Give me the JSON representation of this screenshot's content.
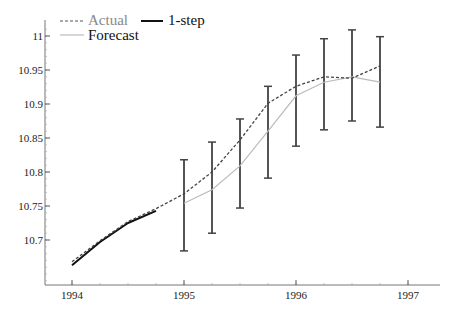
{
  "chart_data": {
    "type": "line",
    "title": "",
    "xlabel": "",
    "ylabel": "",
    "xlim": [
      1993.76,
      1997.2
    ],
    "ylim": [
      10.634,
      11.02
    ],
    "grid": false,
    "legend_position": "top-left",
    "x_ticks": [
      1994,
      1995,
      1996,
      1997
    ],
    "x_tick_labels": [
      "1994",
      "1995",
      "1996",
      "1997"
    ],
    "y_ticks": [
      10.7,
      10.75,
      10.8,
      10.85,
      10.9,
      10.95,
      11
    ],
    "y_tick_labels": [
      "10.7",
      "10.75",
      "10.8",
      "10.85",
      "10.9",
      "10.95",
      "11"
    ],
    "legend": [
      {
        "label": "Actual",
        "style": "dashed",
        "color": "#555555",
        "text_color": "#888888"
      },
      {
        "label": "Forecast",
        "style": "solid-thin",
        "color": "#bbbbbb",
        "text_color": "#111111"
      },
      {
        "label": "1-step",
        "style": "solid-thick",
        "color": "#111111",
        "text_color": "#111111"
      }
    ],
    "series": [
      {
        "name": "Actual",
        "x": [
          1994.0,
          1994.25,
          1994.5,
          1994.75,
          1995.0,
          1995.25,
          1995.5,
          1995.75,
          1996.0,
          1996.25,
          1996.5,
          1996.75
        ],
        "values": [
          10.668,
          10.699,
          10.727,
          10.746,
          10.768,
          10.8,
          10.847,
          10.901,
          10.926,
          10.94,
          10.938,
          10.956
        ]
      },
      {
        "name": "Forecast",
        "x": [
          1995.0,
          1995.25,
          1995.5,
          1995.75,
          1996.0,
          1996.25,
          1996.5,
          1996.75
        ],
        "values": [
          10.754,
          10.774,
          10.809,
          10.86,
          10.912,
          10.932,
          10.94,
          10.932
        ]
      },
      {
        "name": "1-step",
        "x": [
          1994.0,
          1994.25,
          1994.5,
          1994.75
        ],
        "values": [
          10.663,
          10.697,
          10.725,
          10.743
        ]
      },
      {
        "name": "Error bars",
        "x": [
          1995.0,
          1995.25,
          1995.5,
          1995.75,
          1996.0,
          1996.25,
          1996.5,
          1996.75
        ],
        "upper": [
          10.818,
          10.844,
          10.878,
          10.926,
          10.972,
          10.996,
          11.009,
          10.999
        ],
        "lower": [
          10.684,
          10.71,
          10.747,
          10.791,
          10.838,
          10.862,
          10.875,
          10.866
        ]
      }
    ]
  }
}
